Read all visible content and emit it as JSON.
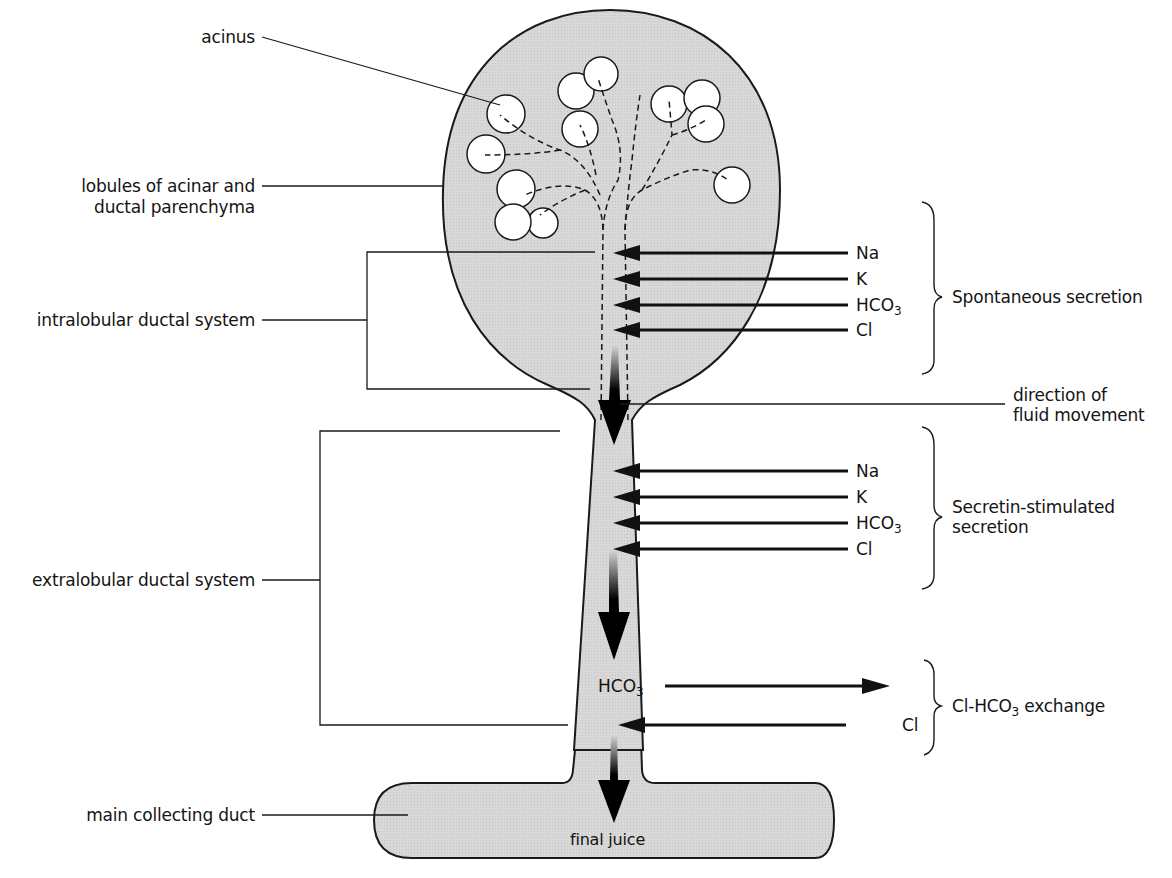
{
  "figure": {
    "type": "schematic"
  },
  "labels_left": {
    "acinus": "acinus",
    "lobules_line1": "lobules of acinar and",
    "lobules_line2": "ductal parenchyma",
    "intralobular": "intralobular ductal system",
    "extralobular": "extralobular ductal system",
    "main_duct": "main collecting duct"
  },
  "labels_right": {
    "direction_line1": "direction of",
    "direction_line2": "fluid movement",
    "final_juice": "final juice"
  },
  "spontaneous": {
    "label": "Spontaneous secretion",
    "ions": [
      {
        "base": "Na",
        "sub": ""
      },
      {
        "base": "K",
        "sub": ""
      },
      {
        "base": "HCO",
        "sub": "3"
      },
      {
        "base": "Cl",
        "sub": ""
      }
    ]
  },
  "secretin": {
    "label_line1": "Secretin-stimulated",
    "label_line2": "secretion",
    "ions": [
      {
        "base": "Na",
        "sub": ""
      },
      {
        "base": "K",
        "sub": ""
      },
      {
        "base": "HCO",
        "sub": "3"
      },
      {
        "base": "Cl",
        "sub": ""
      }
    ]
  },
  "exchange": {
    "label_pre": "Cl-HCO",
    "label_sub": "3",
    "label_post": " exchange",
    "out_ion": {
      "base": "HCO",
      "sub": "3"
    },
    "in_ion": {
      "base": "Cl",
      "sub": ""
    }
  },
  "colors": {
    "tissue_fill": "#d6d6d6",
    "outline": "#1a1a1a",
    "acinus_fill": "#ffffff"
  }
}
